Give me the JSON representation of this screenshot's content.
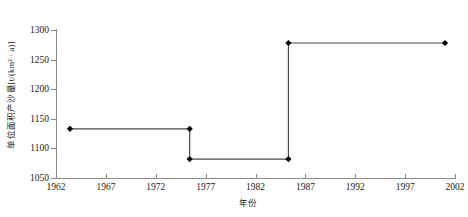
{
  "chart_data": {
    "type": "line",
    "title": "",
    "subtitle": "",
    "xlabel": "年份",
    "ylabel": "单位面积产沙量[t/(km² · a)]",
    "xlim": [
      1962,
      2002
    ],
    "ylim": [
      1050,
      1300
    ],
    "xticks": [
      1962,
      1967,
      1972,
      1977,
      1982,
      1987,
      1992,
      1997,
      2002
    ],
    "yticks": [
      1050,
      1100,
      1150,
      1200,
      1250,
      1300
    ],
    "grid": false,
    "legend": null,
    "line_style": "step",
    "marker": "filled-diamond",
    "series": [
      {
        "name": "单位面积产沙量",
        "x": [
          1963.4,
          1975.4,
          1975.4,
          1985.3,
          1985.3,
          2001.0
        ],
        "values": [
          1133,
          1133,
          1082,
          1082,
          1278,
          1278
        ]
      }
    ],
    "data_points": [
      {
        "x": 1963.4,
        "y": 1133
      },
      {
        "x": 1975.4,
        "y": 1133
      },
      {
        "x": 1975.4,
        "y": 1082
      },
      {
        "x": 1985.3,
        "y": 1082
      },
      {
        "x": 1985.3,
        "y": 1278
      },
      {
        "x": 2001.0,
        "y": 1278
      }
    ],
    "segments": [
      {
        "period": "1963–1975",
        "value": 1133
      },
      {
        "period": "1975–1985",
        "value": 1082
      },
      {
        "period": "1985–2001",
        "value": 1278
      }
    ],
    "colors": {
      "line": "#4d4d4d",
      "marker": "#000000",
      "axis": "#8a8a8a"
    }
  }
}
